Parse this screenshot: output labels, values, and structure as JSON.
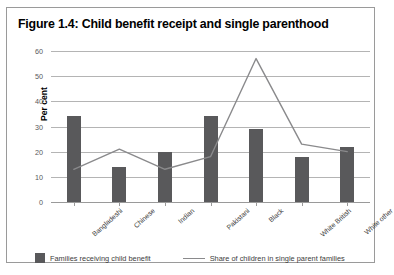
{
  "figure": {
    "title": "Figure 1.4: Child benefit receipt and single parenthood"
  },
  "chart_data": {
    "type": "bar",
    "title": "Figure 1.4: Child benefit receipt and single parenthood",
    "xlabel": "",
    "ylabel": "Per cent",
    "ylim": [
      0,
      60
    ],
    "yticks": [
      0,
      10,
      20,
      30,
      40,
      50,
      60
    ],
    "grid": true,
    "legend_position": "bottom",
    "categories": [
      "Bangladeshi",
      "Chinese",
      "Indian",
      "Pakistani",
      "Black",
      "White British",
      "White other"
    ],
    "series": [
      {
        "name": "Families receiving child benefit",
        "type": "bar",
        "color": "#59595b",
        "values": [
          34,
          14,
          20,
          34,
          29,
          18,
          22
        ]
      },
      {
        "name": "Share of children in single parent families",
        "type": "line",
        "color": "#8a8a8c",
        "values": [
          13,
          21,
          13,
          18,
          57,
          23,
          20
        ]
      }
    ]
  }
}
